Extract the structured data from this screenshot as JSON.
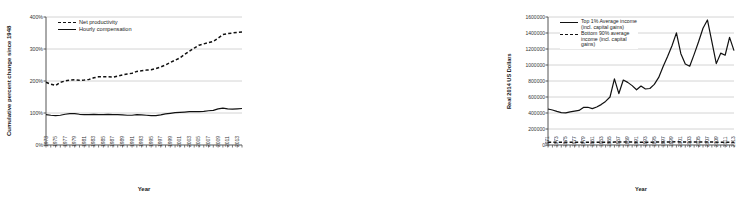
{
  "figure": {
    "panels": [
      "productivity-pay-gap",
      "top1-vs-bottom90-income"
    ]
  },
  "chart_data": [
    {
      "type": "line",
      "id": "productivity-pay-gap",
      "title": "",
      "xlabel": "Year",
      "ylabel": "Cumulative percent change since 1948",
      "xlim": [
        1973,
        2014
      ],
      "ylim": [
        0,
        400
      ],
      "yticks": [
        "0%",
        "100%",
        "200%",
        "300%",
        "400%"
      ],
      "ytick_values": [
        0,
        100,
        200,
        300,
        400
      ],
      "grid": "horizontal",
      "legend_position": "top-left",
      "xticks": [
        "1973",
        "1975",
        "1977",
        "1979",
        "1981",
        "1983",
        "1985",
        "1987",
        "1989",
        "1991",
        "1993",
        "1995",
        "1997",
        "1999",
        "2001",
        "2003",
        "2005",
        "2007",
        "2009",
        "2011",
        "2013"
      ],
      "x": [
        1973,
        1974,
        1975,
        1976,
        1977,
        1978,
        1979,
        1980,
        1981,
        1982,
        1983,
        1984,
        1985,
        1986,
        1987,
        1988,
        1989,
        1990,
        1991,
        1992,
        1993,
        1994,
        1995,
        1996,
        1997,
        1998,
        1999,
        2000,
        2001,
        2002,
        2003,
        2004,
        2005,
        2006,
        2007,
        2008,
        2009,
        2010,
        2011,
        2012,
        2013,
        2014
      ],
      "series": [
        {
          "name": "Net productivity",
          "style": "dashed",
          "values": [
            196,
            190,
            186,
            196,
            200,
            203,
            204,
            202,
            203,
            205,
            210,
            213,
            213,
            213,
            212,
            215,
            219,
            222,
            224,
            230,
            232,
            234,
            235,
            239,
            244,
            250,
            258,
            265,
            272,
            283,
            293,
            303,
            312,
            316,
            320,
            324,
            334,
            345,
            348,
            350,
            352,
            353
          ]
        },
        {
          "name": "Hourly compensation",
          "style": "solid",
          "values": [
            95,
            93,
            92,
            93,
            96,
            98,
            98,
            96,
            95,
            95,
            96,
            95,
            95,
            96,
            95,
            95,
            94,
            93,
            93,
            95,
            94,
            93,
            92,
            92,
            94,
            97,
            99,
            101,
            102,
            103,
            104,
            104,
            104,
            105,
            107,
            108,
            113,
            115,
            113,
            112,
            113,
            114
          ]
        }
      ]
    },
    {
      "type": "line",
      "id": "top1-vs-bottom90-income",
      "title": "",
      "xlabel": "Year",
      "ylabel": "Real 2014 US Dollars",
      "xlim": [
        1971,
        2013
      ],
      "ylim": [
        0,
        1600000
      ],
      "yticks": [
        "0",
        "200000",
        "400000",
        "600000",
        "800000",
        "1000000",
        "1200000",
        "1400000",
        "1600000"
      ],
      "ytick_values": [
        0,
        200000,
        400000,
        600000,
        800000,
        1000000,
        1200000,
        1400000,
        1600000
      ],
      "grid": "horizontal",
      "legend_position": "top-left",
      "xticks": [
        "1971",
        "1973",
        "1975",
        "1977",
        "1979",
        "1981",
        "1983",
        "1985",
        "1987",
        "1989",
        "1991",
        "1993",
        "1995",
        "1997",
        "1999",
        "2001",
        "2003",
        "2005",
        "2007",
        "2009",
        "2011",
        "2013"
      ],
      "x": [
        1971,
        1972,
        1973,
        1974,
        1975,
        1976,
        1977,
        1978,
        1979,
        1980,
        1981,
        1982,
        1983,
        1984,
        1985,
        1986,
        1987,
        1988,
        1989,
        1990,
        1991,
        1992,
        1993,
        1994,
        1995,
        1996,
        1997,
        1998,
        1999,
        2000,
        2001,
        2002,
        2003,
        2004,
        2005,
        2006,
        2007,
        2008,
        2009,
        2010,
        2011,
        2012,
        2013
      ],
      "series": [
        {
          "name": "Top 1% Average income (incl. capital gains)",
          "style": "solid",
          "values": [
            450000,
            437000,
            420000,
            405000,
            402000,
            415000,
            424000,
            432000,
            470000,
            472000,
            455000,
            475000,
            505000,
            545000,
            600000,
            826000,
            643000,
            812000,
            783000,
            742000,
            690000,
            737000,
            700000,
            706000,
            758000,
            845000,
            980000,
            1105000,
            1240000,
            1402000,
            1142000,
            1013000,
            985000,
            1133000,
            1290000,
            1460000,
            1563000,
            1293000,
            1017000,
            1148000,
            1122000,
            1345000,
            1180000,
            1272000
          ]
        },
        {
          "name": "Bottom 90% average income (incl. capital gains)",
          "style": "dashed",
          "values": [
            33000,
            34000,
            35000,
            34000,
            33000,
            34000,
            34000,
            35000,
            35000,
            34000,
            34000,
            33000,
            33000,
            34000,
            35000,
            36000,
            36000,
            36000,
            37000,
            36000,
            35000,
            35000,
            35000,
            35000,
            36000,
            36000,
            37000,
            38000,
            39000,
            40000,
            39000,
            38000,
            37000,
            37000,
            37000,
            38000,
            38000,
            37000,
            35000,
            34000,
            34000,
            34000,
            35000
          ]
        }
      ]
    }
  ]
}
